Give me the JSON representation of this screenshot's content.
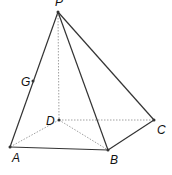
{
  "diagram": {
    "points": {
      "P": {
        "label": "P",
        "x": 58,
        "y": 12,
        "lx": 55,
        "ly": 6
      },
      "A": {
        "label": "A",
        "x": 10,
        "y": 147,
        "lx": 12,
        "ly": 162
      },
      "B": {
        "label": "B",
        "x": 108,
        "y": 150,
        "lx": 110,
        "ly": 164
      },
      "C": {
        "label": "C",
        "x": 154,
        "y": 120,
        "lx": 157,
        "ly": 134
      },
      "D": {
        "label": "D",
        "x": 59,
        "y": 120,
        "lx": 46,
        "ly": 125
      },
      "G": {
        "label": "G",
        "x": 33,
        "y": 81,
        "lx": 21,
        "ly": 86
      }
    },
    "solid_edges": [
      [
        "P",
        "A"
      ],
      [
        "P",
        "B"
      ],
      [
        "P",
        "C"
      ],
      [
        "A",
        "B"
      ],
      [
        "B",
        "C"
      ]
    ],
    "dashed_edges": [
      [
        "P",
        "D"
      ],
      [
        "D",
        "A"
      ],
      [
        "D",
        "B"
      ],
      [
        "D",
        "C"
      ]
    ],
    "colors": {
      "line": "#333333",
      "dashed": "#888888",
      "point": "#333333"
    }
  }
}
